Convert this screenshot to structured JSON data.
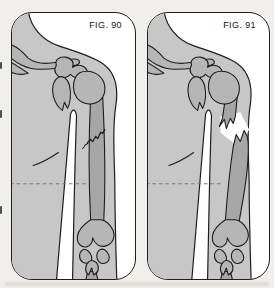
{
  "figures": [
    {
      "label": "FIG. 90",
      "depicts": "arm with hairline fracture of humerus shaft"
    },
    {
      "label": "FIG. 91",
      "depicts": "arm with displaced fracture of humerus shaft"
    }
  ],
  "colors": {
    "c-page": "#f1efec",
    "c-panel": "#ffffff",
    "c-outline": "#1d1d1d",
    "c-body": "#c7c7c7",
    "c-bone": "#b6b6b6",
    "c-shaft": "#a6a6a6",
    "c-dash": "#787878",
    "c-label": "#161616"
  }
}
